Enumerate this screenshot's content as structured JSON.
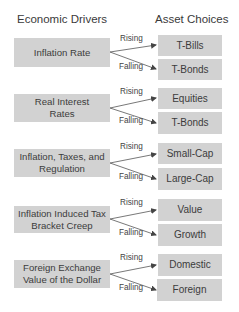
{
  "headers": {
    "left": "Economic Drivers",
    "right": "Asset Choices"
  },
  "arrow_labels": {
    "up": "Rising",
    "down": "Falling"
  },
  "colors": {
    "box_fill": "#d2d2d2",
    "text": "#3c3c3c",
    "arrow": "#444444"
  },
  "groups": [
    {
      "driver": "Inflation Rate",
      "rising": "T-Bills",
      "falling": "T-Bonds"
    },
    {
      "driver": "Real Interest Rates",
      "rising": "Equities",
      "falling": "T-Bonds"
    },
    {
      "driver": "Inflation, Taxes, and Regulation",
      "rising": "Small-Cap",
      "falling": "Large-Cap"
    },
    {
      "driver": "Inflation Induced Tax Bracket Creep",
      "rising": "Value",
      "falling": "Growth"
    },
    {
      "driver": "Foreign Exchange Value of the Dollar",
      "rising": "Domestic",
      "falling": "Foreign"
    }
  ]
}
